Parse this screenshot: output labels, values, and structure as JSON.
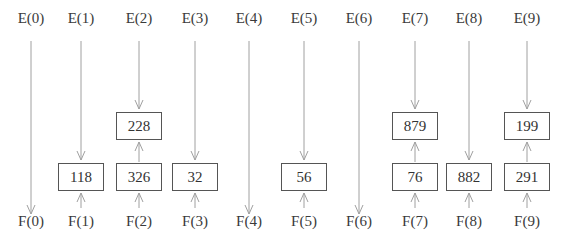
{
  "diagram": {
    "columns": [
      {
        "e_label": "E(0)",
        "f_label": "F(0)",
        "x": 31,
        "lower": null,
        "upper": null
      },
      {
        "e_label": "E(1)",
        "f_label": "F(1)",
        "x": 81,
        "lower": "118",
        "upper": null
      },
      {
        "e_label": "E(2)",
        "f_label": "F(2)",
        "x": 139,
        "lower": "326",
        "upper": "228"
      },
      {
        "e_label": "E(3)",
        "f_label": "F(3)",
        "x": 195,
        "lower": "32",
        "upper": null
      },
      {
        "e_label": "E(4)",
        "f_label": "F(4)",
        "x": 249,
        "lower": null,
        "upper": null
      },
      {
        "e_label": "E(5)",
        "f_label": "F(5)",
        "x": 304,
        "lower": "56",
        "upper": null
      },
      {
        "e_label": "E(6)",
        "f_label": "F(6)",
        "x": 359,
        "lower": null,
        "upper": null
      },
      {
        "e_label": "E(7)",
        "f_label": "F(7)",
        "x": 415,
        "lower": "76",
        "upper": "879"
      },
      {
        "e_label": "E(8)",
        "f_label": "F(8)",
        "x": 469,
        "lower": "882",
        "upper": null
      },
      {
        "e_label": "E(9)",
        "f_label": "F(9)",
        "x": 527,
        "lower": "291",
        "upper": "199"
      }
    ],
    "colors": {
      "arrow": "#a0a0a0",
      "box_border": "#555555",
      "text": "#333333"
    }
  }
}
